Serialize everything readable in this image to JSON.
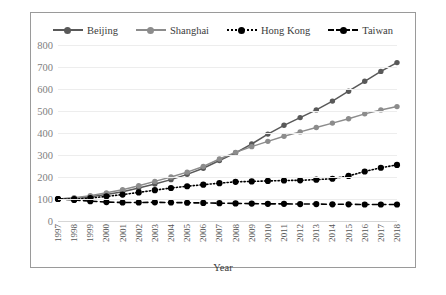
{
  "chart_data": {
    "type": "line",
    "title": "",
    "xlabel": "Year",
    "ylabel": "",
    "ylim": [
      0,
      800
    ],
    "yticks": [
      0,
      100,
      200,
      300,
      400,
      500,
      600,
      700,
      800
    ],
    "grid": true,
    "legend_position": "top-center",
    "categories": [
      "1997",
      "1998",
      "1999",
      "2000",
      "2001",
      "2002",
      "2003",
      "2004",
      "2005",
      "2006",
      "2007",
      "2008",
      "2009",
      "2010",
      "2011",
      "2012",
      "2013",
      "2014",
      "2015",
      "2016",
      "2017",
      "2018"
    ],
    "series": [
      {
        "name": "Beijing",
        "color": "#595959",
        "line_style": "solid",
        "marker": "circle",
        "values": [
          100,
          103,
          110,
          120,
          133,
          150,
          168,
          188,
          212,
          240,
          275,
          310,
          350,
          395,
          435,
          470,
          505,
          545,
          590,
          635,
          680,
          720
        ]
      },
      {
        "name": "Shanghai",
        "color": "#8c8c8c",
        "line_style": "solid",
        "marker": "circle",
        "values": [
          100,
          106,
          115,
          128,
          142,
          160,
          180,
          200,
          222,
          248,
          282,
          312,
          338,
          362,
          385,
          405,
          425,
          445,
          465,
          487,
          505,
          520
        ]
      },
      {
        "name": "Hong Kong",
        "color": "#000000",
        "line_style": "dotted",
        "marker": "circle",
        "values": [
          100,
          99,
          104,
          112,
          120,
          130,
          140,
          150,
          158,
          165,
          172,
          178,
          180,
          182,
          184,
          185,
          188,
          192,
          205,
          225,
          242,
          255
        ]
      },
      {
        "name": "Taiwan",
        "color": "#000000",
        "line_style": "dashed",
        "marker": "circle",
        "values": [
          100,
          96,
          90,
          86,
          84,
          84,
          85,
          84,
          83,
          82,
          81,
          80,
          79,
          78,
          78,
          77,
          77,
          76,
          76,
          75,
          75,
          75
        ]
      }
    ]
  }
}
